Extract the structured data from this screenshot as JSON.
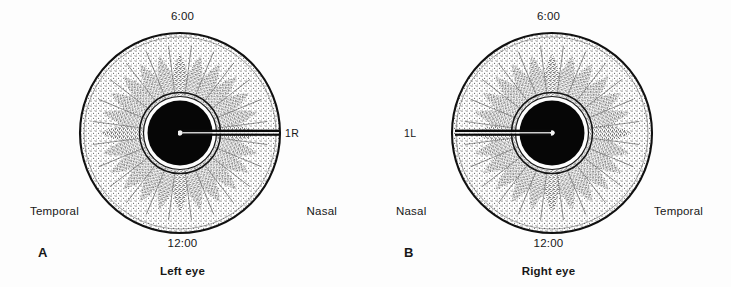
{
  "figure": {
    "background_color": "#fdfdfd",
    "ink_color": "#111111",
    "panels": [
      {
        "letter": "A",
        "caption": "Left eye",
        "clock_top": "6:00",
        "clock_bottom": "12:00",
        "side_left": "Temporal",
        "side_right": "Nasal",
        "marker_label": "1R",
        "marker_side": "right"
      },
      {
        "letter": "B",
        "caption": "Right eye",
        "clock_top": "6:00",
        "clock_bottom": "12:00",
        "side_left": "Nasal",
        "side_right": "Temporal",
        "marker_label": "1L",
        "marker_side": "left"
      }
    ]
  }
}
